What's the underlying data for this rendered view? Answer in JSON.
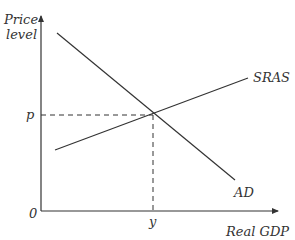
{
  "diagram": {
    "type": "AD-SRAS macroeconomic equilibrium",
    "y_axis": {
      "label_line1": "Price",
      "label_line2": "level"
    },
    "x_axis": {
      "label": "Real GDP"
    },
    "origin_label": "0",
    "curves": [
      {
        "name": "SRAS",
        "label": "SRAS"
      },
      {
        "name": "AD",
        "label": "AD"
      }
    ],
    "equilibrium": {
      "price_label": "p",
      "output_label": "y"
    },
    "colors": {
      "line": "#333333",
      "background": "#ffffff"
    }
  }
}
